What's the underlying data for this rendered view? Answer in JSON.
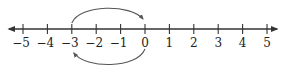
{
  "chart_data": {
    "type": "number-line",
    "title": "",
    "range": [
      -5,
      5
    ],
    "ticks": [
      -5,
      -4,
      -3,
      -2,
      -1,
      0,
      1,
      2,
      3,
      4,
      5
    ],
    "tick_labels": [
      "−5",
      "−4",
      "−3",
      "−2",
      "−1",
      "0",
      "1",
      "2",
      "3",
      "4",
      "5"
    ],
    "arrows_on_axis": "both-ends",
    "arcs": [
      {
        "name": "top-arc",
        "from": -3,
        "to": 0,
        "side": "above",
        "arrowhead_at": 0
      },
      {
        "name": "bottom-arc",
        "from": 0,
        "to": -3,
        "side": "below",
        "arrowhead_at": -3
      }
    ],
    "colors": {
      "axis": "#333333",
      "arc": "#555555"
    }
  }
}
